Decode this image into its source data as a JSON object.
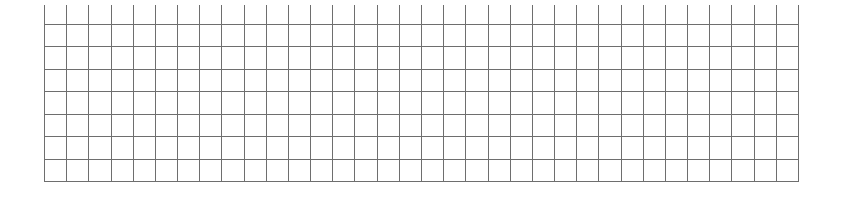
{
  "grid": {
    "columns": 34,
    "rows": 7,
    "left": 44,
    "right": 798,
    "top": 24,
    "bottom": 181,
    "tick_top": 5,
    "line_color": "#6e6e6e",
    "background": "#ffffff"
  }
}
